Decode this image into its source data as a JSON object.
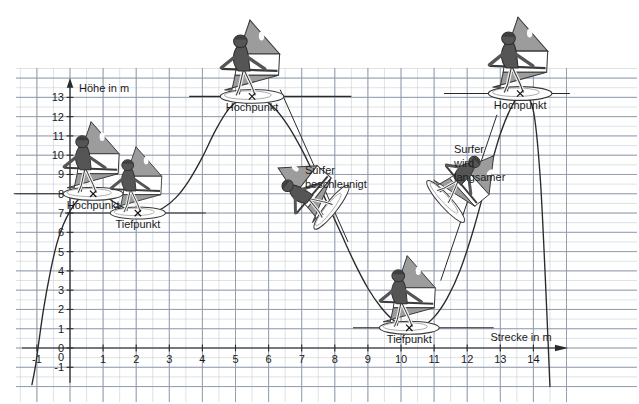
{
  "figure": {
    "background": "#ffffff",
    "grid_major_color": "#8e9aab",
    "grid_minor_color": "#c3cad4",
    "curve_color": "#2a2a2a",
    "text_color": "#1a1a1a",
    "sail_gray": "#9c9c9c",
    "sail_white": "#ffffff",
    "body_gray": "#555555",
    "board_white": "#fdfdfd"
  },
  "chart_data": {
    "type": "line",
    "title": "",
    "xlabel": "Strecke in m",
    "ylabel": "Höhe in m",
    "xlim": [
      -1.8,
      15.2
    ],
    "ylim": [
      -2.2,
      14.6
    ],
    "xticks": [
      -1,
      0,
      1,
      2,
      3,
      4,
      5,
      6,
      7,
      8,
      9,
      10,
      11,
      12,
      13,
      14
    ],
    "xticklabels": [
      "-1",
      "0",
      "1",
      "2",
      "3",
      "4",
      "5",
      "6",
      "7",
      "8",
      "9",
      "10",
      "11",
      "12",
      "13",
      "14"
    ],
    "yticks": [
      -1,
      0,
      1,
      2,
      3,
      4,
      5,
      6,
      7,
      8,
      9,
      10,
      11,
      12,
      13
    ],
    "yticklabels": [
      "-1",
      "0",
      "1",
      "2",
      "3",
      "4",
      "5",
      "6",
      "7",
      "8",
      "9",
      "10",
      "11",
      "12",
      "13"
    ],
    "grid": true,
    "grid_minor_step": 0.5,
    "legend": "none",
    "series": [
      {
        "name": "Höhenprofil des Surfers",
        "x": [
          -1.15,
          -1.05,
          -0.95,
          -0.8,
          -0.6,
          -0.4,
          -0.2,
          0.0,
          0.2,
          0.4,
          0.6,
          0.8,
          1.0,
          1.3,
          1.6,
          2.0,
          2.4,
          2.8,
          3.2,
          3.6,
          4.0,
          4.4,
          4.8,
          5.2,
          5.5,
          5.8,
          6.2,
          6.6,
          7.0,
          7.4,
          7.8,
          8.2,
          8.6,
          9.0,
          9.4,
          9.8,
          10.2,
          10.6,
          11.0,
          11.4,
          11.8,
          12.2,
          12.6,
          13.0,
          13.4,
          13.7,
          14.0,
          14.2,
          14.35,
          14.5
        ],
        "y": [
          -1.9,
          -1.0,
          0.2,
          2.0,
          3.9,
          5.4,
          6.4,
          7.1,
          7.6,
          7.9,
          8.05,
          8.05,
          7.95,
          7.6,
          7.3,
          7.0,
          7.0,
          7.25,
          7.8,
          8.7,
          9.9,
          11.3,
          12.4,
          12.95,
          13.05,
          12.95,
          12.4,
          11.5,
          10.3,
          8.9,
          7.4,
          5.9,
          4.4,
          3.1,
          2.1,
          1.4,
          1.05,
          1.1,
          1.6,
          2.6,
          4.1,
          6.2,
          8.7,
          11.1,
          12.7,
          13.2,
          12.3,
          9.0,
          4.0,
          -2.0
        ]
      }
    ],
    "annotations": [
      {
        "id": "hochpunkt-left",
        "label": "Hochpunkt",
        "x": 0.7,
        "y": 8.0,
        "kind": "maximum",
        "marker": "x"
      },
      {
        "id": "tiefpunkt-left",
        "label": "Tiefpunkt",
        "x": 2.05,
        "y": 7.0,
        "kind": "minimum",
        "marker": "x"
      },
      {
        "id": "hochpunkt-mid",
        "label": "Hochpunkt",
        "x": 5.5,
        "y": 13.05,
        "kind": "maximum",
        "marker": "x"
      },
      {
        "id": "tiefpunkt-right",
        "label": "Tiefpunkt",
        "x": 10.25,
        "y": 1.05,
        "kind": "minimum",
        "marker": "x"
      },
      {
        "id": "hochpunkt-right",
        "label": "Hochpunkt",
        "x": 13.6,
        "y": 13.2,
        "kind": "maximum",
        "marker": "x"
      },
      {
        "id": "note-beschleunigt",
        "label_line1": "Surfer",
        "label_line2": "beschleunigt",
        "x": 7.1,
        "y": 9.0,
        "kind": "note"
      },
      {
        "id": "note-langsamer",
        "label_line1": "Surfer",
        "label_line2": "wird",
        "label_line3": "langsamer",
        "x": 11.6,
        "y": 10.1,
        "kind": "note"
      }
    ],
    "tangent_lines": [
      {
        "id": "tangent-beschleunigt",
        "x1": 6.35,
        "y1": 13.4,
        "x2": 8.4,
        "y2": 5.5
      },
      {
        "id": "tangent-langsamer",
        "x1": 11.2,
        "y1": 3.5,
        "x2": 12.9,
        "y2": 12.1
      }
    ],
    "level_lines": [
      {
        "id": "level-hochpunkt-left",
        "y": 8.0,
        "x1": -1.7,
        "x2": 2.55
      },
      {
        "id": "level-tiefpunkt-left",
        "y": 7.0,
        "x1": -0.15,
        "x2": 4.1
      },
      {
        "id": "level-hochpunkt-mid",
        "y": 13.05,
        "x1": 3.6,
        "x2": 8.5
      },
      {
        "id": "level-tiefpunkt-right",
        "y": 1.05,
        "x1": 8.55,
        "x2": 12.8
      },
      {
        "id": "level-hochpunkt-right",
        "y": 13.2,
        "x1": 11.3,
        "x2": 15.1
      }
    ],
    "surfers": [
      {
        "id": "surfer-1",
        "x": 0.7,
        "y": 8.0,
        "scale": 1.0,
        "rotation": 0
      },
      {
        "id": "surfer-2",
        "x": 2.05,
        "y": 7.0,
        "scale": 0.92,
        "rotation": 0
      },
      {
        "id": "surfer-3",
        "x": 5.5,
        "y": 13.05,
        "scale": 1.06,
        "rotation": 0
      },
      {
        "id": "surfer-4",
        "x": 7.9,
        "y": 7.3,
        "scale": 0.92,
        "rotation": -52
      },
      {
        "id": "surfer-5",
        "x": 10.25,
        "y": 1.05,
        "scale": 1.0,
        "rotation": 0
      },
      {
        "id": "surfer-6",
        "x": 11.35,
        "y": 7.6,
        "scale": 0.92,
        "rotation": 48
      },
      {
        "id": "surfer-7",
        "x": 13.6,
        "y": 13.2,
        "scale": 1.06,
        "rotation": 0
      }
    ]
  },
  "axis_labels": {
    "y_axis_caption": "Höhe in m",
    "x_axis_caption": "Strecke in m"
  },
  "header_artifact": {
    "text": ""
  }
}
